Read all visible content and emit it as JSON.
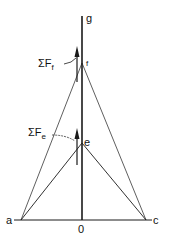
{
  "diagram": {
    "points": {
      "a": {
        "label": "a",
        "x": 21,
        "y": 220
      },
      "c": {
        "label": "c",
        "x": 146,
        "y": 220
      },
      "o": {
        "label": "0",
        "x": 82,
        "y": 220
      },
      "e": {
        "label": "e",
        "x": 82,
        "y": 143
      },
      "f": {
        "label": "f",
        "x": 82,
        "y": 63
      },
      "g": {
        "label": "g",
        "x": 82,
        "y": 15
      }
    },
    "forces": {
      "sum_f": {
        "label": "ΣF",
        "subscript": "f"
      },
      "sum_e": {
        "label": "ΣF",
        "subscript": "e"
      }
    },
    "colors": {
      "line": "#1a1a1a",
      "background": "#ffffff"
    }
  }
}
